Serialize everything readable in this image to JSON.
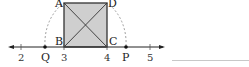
{
  "figure": {
    "square": {
      "vertices": {
        "A": "A",
        "B": "B",
        "C": "C",
        "D": "D"
      },
      "fill": "#cfcfcf",
      "stroke": "#333333"
    },
    "number_line": {
      "ticks": [
        {
          "label": "2",
          "value": 2
        },
        {
          "label": "3",
          "value": 3
        },
        {
          "label": "4",
          "value": 4
        },
        {
          "label": "5",
          "value": 5
        }
      ],
      "points": [
        {
          "label": "Q",
          "position": "left of 3"
        },
        {
          "label": "P",
          "position": "right of 4"
        }
      ]
    },
    "labels": {
      "A": "A",
      "B": "B",
      "C": "C",
      "D": "D",
      "Q": "Q",
      "P": "P",
      "t2": "2",
      "t3": "3",
      "t4": "4",
      "t5": "5"
    }
  },
  "answer_blank": ""
}
